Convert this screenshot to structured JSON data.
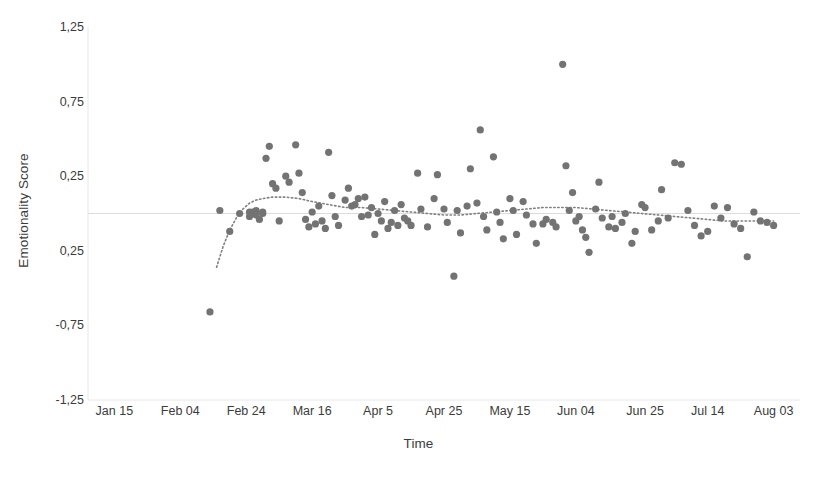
{
  "chart_data": {
    "type": "scatter",
    "title": "",
    "xlabel": "Time",
    "ylabel": "Emotionality Score",
    "grid": false,
    "legend": "none",
    "ylim": [
      -1.25,
      1.25
    ],
    "ytick_labels": [
      "1,25",
      "0,75",
      "0,25",
      "0,25",
      "-0,75",
      "-1,25"
    ],
    "ytick_values": [
      1.25,
      0.75,
      0.25,
      -0.25,
      -0.75,
      -1.25
    ],
    "xtick_labels": [
      "Jan 15",
      "Feb 04",
      "Feb 24",
      "Mar 16",
      "Apr 5",
      "Apr 25",
      "May 15",
      "Jun 04",
      "Jun 25",
      "Jul 14",
      "Aug 03"
    ],
    "xtick_values": [
      0,
      20,
      40,
      60,
      80,
      100,
      120,
      140,
      161,
      180,
      200
    ],
    "xlim": [
      -8,
      208
    ],
    "marker_color": "#737373",
    "trendline_color": "#808080",
    "trendline_style": "dotted",
    "baseline_value": 0,
    "series": [
      {
        "name": "Emotionality Score",
        "x": [
          32,
          29,
          35,
          38,
          41,
          41,
          42,
          42,
          43,
          43,
          44,
          45,
          45,
          46,
          47,
          48,
          49,
          50,
          52,
          53,
          55,
          56,
          57,
          58,
          59,
          60,
          61,
          62,
          63,
          64,
          65,
          66,
          67,
          68,
          70,
          71,
          72,
          73,
          74,
          75,
          76,
          77,
          78,
          79,
          80,
          81,
          82,
          83,
          84,
          85,
          86,
          87,
          88,
          89,
          90,
          92,
          93,
          95,
          97,
          98,
          100,
          101,
          103,
          104,
          105,
          107,
          108,
          110,
          111,
          112,
          113,
          115,
          116,
          117,
          118,
          120,
          121,
          122,
          124,
          125,
          127,
          128,
          130,
          131,
          133,
          134,
          136,
          137,
          138,
          139,
          140,
          141,
          142,
          143,
          144,
          146,
          147,
          148,
          150,
          151,
          152,
          154,
          155,
          157,
          158,
          160,
          161,
          163,
          165,
          166,
          168,
          170,
          172,
          174,
          176,
          178,
          180,
          182,
          184,
          186,
          188,
          190,
          192,
          194,
          196,
          198,
          200
        ],
        "y": [
          0.02,
          -0.66,
          -0.12,
          0.0,
          0.01,
          -0.02,
          0.01,
          0.0,
          -0.01,
          0.02,
          -0.04,
          0.0,
          0.01,
          0.37,
          0.45,
          0.2,
          0.17,
          -0.05,
          0.25,
          0.21,
          0.46,
          0.27,
          0.14,
          -0.04,
          -0.09,
          0.01,
          -0.07,
          0.05,
          -0.05,
          -0.1,
          0.41,
          0.12,
          -0.02,
          -0.08,
          0.09,
          0.17,
          0.05,
          0.06,
          0.1,
          -0.02,
          0.11,
          -0.01,
          0.04,
          -0.14,
          0.0,
          -0.05,
          0.08,
          -0.1,
          -0.06,
          0.02,
          -0.08,
          0.06,
          -0.03,
          -0.05,
          -0.08,
          0.27,
          0.03,
          -0.09,
          0.1,
          0.26,
          0.03,
          -0.06,
          -0.42,
          0.02,
          -0.13,
          0.05,
          0.3,
          0.07,
          0.56,
          -0.02,
          -0.11,
          0.38,
          0.01,
          -0.06,
          -0.17,
          0.1,
          0.02,
          -0.14,
          0.08,
          -0.01,
          -0.07,
          -0.2,
          -0.07,
          -0.04,
          -0.06,
          -0.09,
          1.0,
          0.32,
          0.02,
          0.14,
          -0.05,
          -0.02,
          -0.11,
          -0.16,
          -0.26,
          0.03,
          0.21,
          -0.03,
          -0.09,
          -0.02,
          -0.1,
          -0.06,
          0.0,
          -0.2,
          -0.12,
          0.06,
          0.04,
          -0.11,
          -0.05,
          0.16,
          -0.03,
          0.34,
          0.33,
          0.02,
          -0.08,
          -0.15,
          -0.12,
          0.05,
          -0.03,
          0.04,
          -0.07,
          -0.1,
          -0.29,
          0.01,
          -0.05,
          -0.06,
          -0.08
        ]
      }
    ],
    "trendline": {
      "name": "polynomial-trend",
      "x": [
        31,
        33,
        35,
        37,
        39,
        41,
        43,
        45,
        48,
        52,
        56,
        60,
        65,
        70,
        75,
        80,
        85,
        90,
        95,
        100,
        105,
        110,
        115,
        120,
        125,
        130,
        135,
        140,
        145,
        150,
        155,
        160,
        165,
        170,
        175,
        180,
        185,
        190,
        195,
        200
      ],
      "y": [
        -0.36,
        -0.22,
        -0.11,
        -0.03,
        0.03,
        0.07,
        0.09,
        0.1,
        0.11,
        0.11,
        0.1,
        0.08,
        0.06,
        0.04,
        0.04,
        0.03,
        0.02,
        0.01,
        0.0,
        -0.01,
        -0.01,
        0.0,
        0.01,
        0.02,
        0.03,
        0.04,
        0.04,
        0.04,
        0.03,
        0.02,
        0.01,
        0.0,
        -0.01,
        -0.02,
        -0.03,
        -0.04,
        -0.05,
        -0.05,
        -0.05,
        -0.05
      ]
    }
  }
}
